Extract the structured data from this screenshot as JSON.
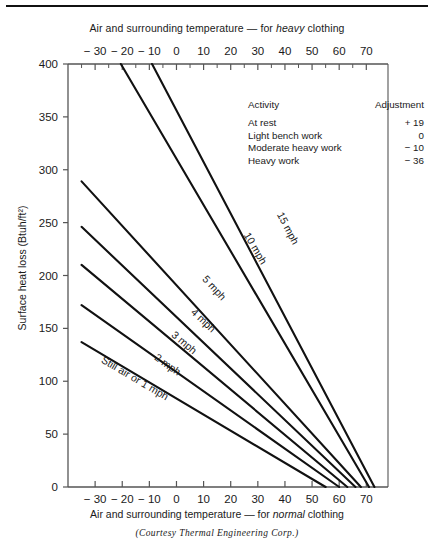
{
  "figure": {
    "top_axis_title_pre": "Air and surrounding temperature ",
    "top_axis_title_dash": "— for ",
    "top_axis_title_em": "heavy",
    "top_axis_title_post": " clothing",
    "bottom_axis_title_pre": "Air and surrounding temperature ",
    "bottom_axis_title_dash": "— for ",
    "bottom_axis_title_em": "normal",
    "bottom_axis_title_post": " clothing",
    "ylabel": "Surface heat loss (Btuh/ft²)",
    "credit": "(Courtesy Thermal Engineering Corp.)",
    "line_color": "#111111",
    "axis_color": "#555555",
    "text_color": "#1a1a1a"
  },
  "legend": {
    "header_activity": "Activity",
    "header_adjustment": "Adjustment",
    "rows": [
      {
        "activity": "At rest",
        "adjustment": "+ 19"
      },
      {
        "activity": "Light bench work",
        "adjustment": "0"
      },
      {
        "activity": "Moderate heavy work",
        "adjustment": "− 10"
      },
      {
        "activity": "Heavy work",
        "adjustment": "− 36"
      }
    ]
  },
  "chart_data": {
    "type": "line",
    "xlabel": "Air and surrounding temperature — for normal clothing",
    "xlabel_top": "Air and surrounding temperature — for heavy clothing",
    "ylabel": "Surface heat loss (Btuh/ft²)",
    "xlim": [
      -40,
      78
    ],
    "ylim": [
      0,
      400
    ],
    "grid": false,
    "legend_position": "inline-curve-labels",
    "x_ticks_major": [
      -30,
      -20,
      -10,
      0,
      10,
      20,
      30,
      40,
      50,
      60,
      70
    ],
    "x_tick_labels": [
      "− 30",
      "− 20",
      "− 10",
      "0",
      "10",
      "20",
      "30",
      "40",
      "50",
      "60",
      "70"
    ],
    "x_ticks_minor": [
      -35,
      -25,
      -15,
      -5,
      5,
      15,
      25,
      35,
      45,
      55,
      65
    ],
    "y_ticks": [
      0,
      50,
      100,
      150,
      200,
      250,
      300,
      350,
      400
    ],
    "y_tick_labels": [
      "0",
      "50",
      "100",
      "150",
      "200",
      "250",
      "300",
      "350",
      "400"
    ],
    "series": [
      {
        "name": "Still air or 1 mph",
        "label": "Still air or 1 mph",
        "points": [
          [
            -35,
            137
          ],
          [
            55,
            0
          ]
        ],
        "label_x": -16,
        "label_y": 100
      },
      {
        "name": "2 mph",
        "label": "2 mph",
        "points": [
          [
            -35,
            172
          ],
          [
            60,
            0
          ]
        ],
        "label_x": -4,
        "label_y": 113
      },
      {
        "name": "3 mph",
        "label": "3 mph",
        "points": [
          [
            -35,
            210
          ],
          [
            63,
            0
          ]
        ],
        "label_x": 2,
        "label_y": 134
      },
      {
        "name": "4 mph",
        "label": "4 mph",
        "points": [
          [
            -35,
            246
          ],
          [
            66,
            0
          ]
        ],
        "label_x": 9,
        "label_y": 155
      },
      {
        "name": "5 mph",
        "label": "5 mph",
        "points": [
          [
            -35,
            289
          ],
          [
            68,
            0
          ]
        ],
        "label_x": 13,
        "label_y": 186
      },
      {
        "name": "10 mph",
        "label": "10 mph",
        "points": [
          [
            -20.5,
            400
          ],
          [
            71,
            0
          ]
        ],
        "label_x": 28,
        "label_y": 224
      },
      {
        "name": "15 mph",
        "label": "15 mph",
        "points": [
          [
            -9,
            400
          ],
          [
            73,
            0
          ]
        ],
        "label_x": 40,
        "label_y": 243
      }
    ]
  }
}
